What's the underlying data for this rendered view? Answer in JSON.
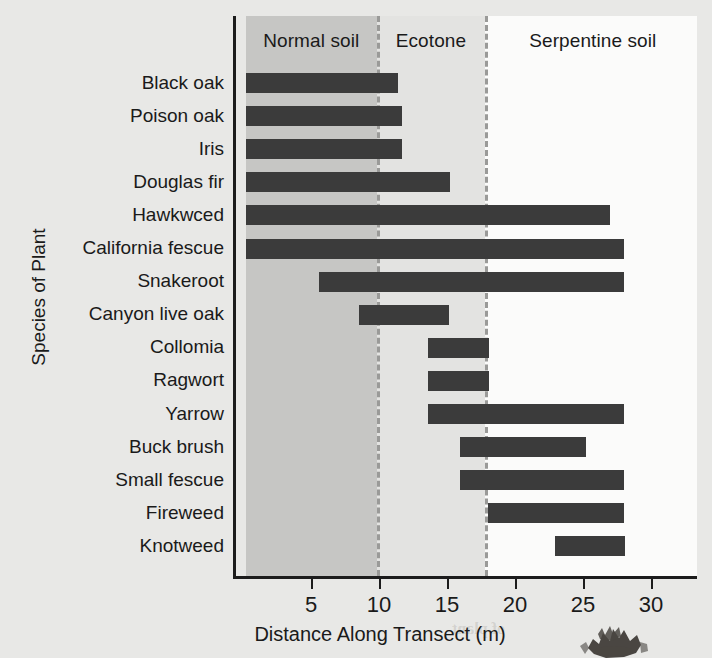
{
  "chart_data": {
    "type": "bar",
    "orientation": "horizontal",
    "title": "",
    "xlabel": "Distance Along Transect (m)",
    "ylabel": "Species of Plant",
    "xlim": [
      0,
      33.4
    ],
    "xticks": [
      5,
      10,
      15,
      20,
      25,
      30
    ],
    "xtick_labels": [
      "5",
      "10",
      "15",
      "20",
      "25",
      "30"
    ],
    "grid": false,
    "legend": "none",
    "categories": [
      "Black oak",
      "Poison oak",
      "Iris",
      "Douglas fir",
      "Hawkwced",
      "California fescue",
      "Snakeroot",
      "Canyon live oak",
      "Collomia",
      "Ragwort",
      "Yarrow",
      "Buck brush",
      "Small fescue",
      "Fireweed",
      "Knotweed"
    ],
    "bars": [
      {
        "label": "Black oak",
        "start": 0.0,
        "end": 11.2
      },
      {
        "label": "Poison oak",
        "start": 0.0,
        "end": 11.5
      },
      {
        "label": "Iris",
        "start": 0.0,
        "end": 11.5
      },
      {
        "label": "Douglas fir",
        "start": 0.0,
        "end": 15.0
      },
      {
        "label": "Hawkwced",
        "start": 0.0,
        "end": 26.8
      },
      {
        "label": "California fescue",
        "start": 0.0,
        "end": 27.8
      },
      {
        "label": "Snakeroot",
        "start": 5.4,
        "end": 27.8
      },
      {
        "label": "Canyon live oak",
        "start": 8.3,
        "end": 14.9
      },
      {
        "label": "Collomia",
        "start": 13.4,
        "end": 17.9
      },
      {
        "label": "Ragwort",
        "start": 13.4,
        "end": 17.9
      },
      {
        "label": "Yarrow",
        "start": 13.4,
        "end": 27.8
      },
      {
        "label": "Buck brush",
        "start": 15.7,
        "end": 25.0
      },
      {
        "label": "Small fescue",
        "start": 15.7,
        "end": 27.8
      },
      {
        "label": "Fireweed",
        "start": 17.8,
        "end": 27.8
      },
      {
        "label": "Knotweed",
        "start": 22.7,
        "end": 27.9
      }
    ],
    "regions": [
      {
        "name": "Normal soil",
        "start": 0.0,
        "end": 9.6,
        "color": "#c6c6c4"
      },
      {
        "name": "Ecotone",
        "start": 9.6,
        "end": 17.6,
        "color": "#e3e3e1"
      },
      {
        "name": "Serpentine soil",
        "start": 17.6,
        "end": 33.4,
        "color": "#fbfbfa"
      }
    ],
    "region_boundaries": [
      9.6,
      17.6
    ],
    "bar_color": "#3b3b3b",
    "axis_color": "#1c1c1c"
  },
  "ghost_text": [
    {
      "text": "Serpentine soils",
      "x": 318,
      "y": 28,
      "size": 21
    },
    {
      "text": "specialized niches are soils",
      "x": 300,
      "y": 72,
      "size": 21
    },
    {
      "text": "those only under the",
      "x": 318,
      "y": 112,
      "size": 15
    },
    {
      "text": "tes, plants with ranges",
      "x": 308,
      "y": 136,
      "size": 15
    },
    {
      "text": "and tolerance for",
      "x": 320,
      "y": 160,
      "size": 15
    },
    {
      "text": "o effect modified",
      "x": 316,
      "y": 268,
      "size": 16
    },
    {
      "text": "of each with a gradient",
      "x": 300,
      "y": 296,
      "size": 16
    },
    {
      "text": "plants with a wide",
      "x": 314,
      "y": 322,
      "size": 16
    },
    {
      "text": "Niche",
      "x": 486,
      "y": 460,
      "size": 20
    },
    {
      "text": "ecological niches of",
      "x": 420,
      "y": 492,
      "size": 18
    },
    {
      "text": "similar to",
      "x": 496,
      "y": 522,
      "size": 14
    },
    {
      "text": "of plant",
      "x": 452,
      "y": 620,
      "size": 16
    }
  ],
  "images": {
    "plant_photo": "serpentine-plant-photo"
  }
}
